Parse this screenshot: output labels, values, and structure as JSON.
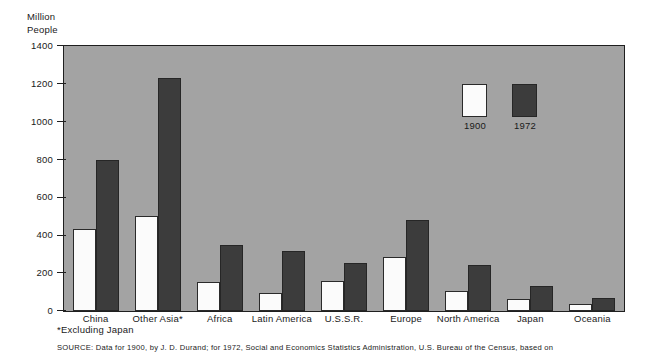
{
  "axis_unit_label": "Million\nPeople",
  "footnote": "*Excluding Japan",
  "source_note": "SOURCE: Data for 1900, by J. D. Durand; for 1972, Social and Economics Statistics Administration, U.S. Bureau of the Census, based on",
  "legend": {
    "items": [
      {
        "label": "1900",
        "color": "#fbfbfb"
      },
      {
        "label": "1972",
        "color": "#3c3c3c"
      }
    ]
  },
  "chart_data": {
    "type": "bar",
    "title": "",
    "xlabel": "",
    "ylabel": "Million People",
    "ylim": [
      0,
      1400
    ],
    "yticks": [
      0,
      200,
      400,
      600,
      800,
      1000,
      1200,
      1400
    ],
    "ytick_labels": [
      "0",
      "200",
      "400",
      "600",
      "800",
      "1000",
      "1200",
      "1400"
    ],
    "grid": false,
    "legend_position": "inside-upper-right",
    "categories": [
      "China",
      "Other Asia*",
      "Africa",
      "Latin America",
      "U.S.S.R.",
      "Europe",
      "North America",
      "Japan",
      "Oceania"
    ],
    "series": [
      {
        "name": "1900",
        "color": "#fbfbfb",
        "values": [
          435,
          500,
          155,
          95,
          160,
          285,
          105,
          65,
          35
        ]
      },
      {
        "name": "1972",
        "color": "#3c3c3c",
        "values": [
          800,
          1230,
          350,
          315,
          255,
          480,
          245,
          130,
          70
        ]
      }
    ],
    "annotations": [
      "*Excluding Japan"
    ]
  }
}
